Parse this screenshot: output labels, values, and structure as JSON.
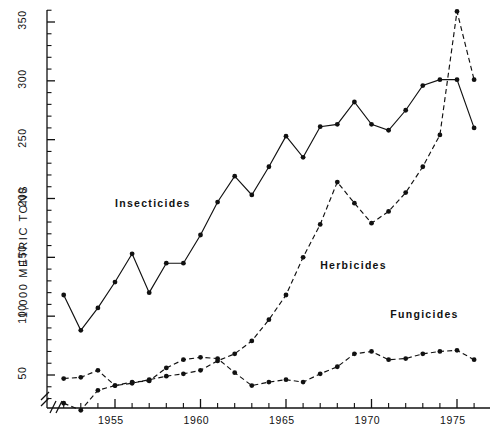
{
  "chart_data": {
    "type": "line",
    "title": "",
    "xlabel": "",
    "ylabel": "1,000 METRIC TONS",
    "xlim": [
      1951.2,
      1976.6
    ],
    "ylim": [
      14,
      372
    ],
    "grid": false,
    "legend": "inline-annotations",
    "axis_break": "//",
    "x_ticks_major": [
      "1955",
      "1960",
      "1965",
      "1970",
      "1975"
    ],
    "x_ticks_major_values": [
      1955,
      1960,
      1965,
      1970,
      1975
    ],
    "x_ticks_minor_values": [
      1952,
      1953,
      1954,
      1956,
      1957,
      1958,
      1959,
      1961,
      1962,
      1963,
      1964,
      1966,
      1967,
      1968,
      1969,
      1971,
      1972,
      1973,
      1974,
      1976
    ],
    "y_ticks_major": [
      "50",
      "100",
      "150",
      "200",
      "250",
      "300",
      "350"
    ],
    "y_ticks_major_values": [
      50,
      100,
      150,
      200,
      250,
      300,
      350
    ],
    "y_ticks_minor_values": [
      20,
      30,
      40,
      60,
      70,
      80,
      90,
      110,
      120,
      130,
      140,
      160,
      170,
      180,
      190,
      210,
      220,
      230,
      240,
      260,
      270,
      280,
      290,
      310,
      320,
      330,
      340,
      360,
      370
    ],
    "series": [
      {
        "name": "Insecticides",
        "style": "solid",
        "marker": "filled-circle",
        "label_x": 1955.0,
        "label_y": 195,
        "x": [
          1952,
          1953,
          1954,
          1955,
          1956,
          1957,
          1958,
          1959,
          1960,
          1961,
          1962,
          1963,
          1964,
          1965,
          1966,
          1967,
          1968,
          1969,
          1970,
          1971,
          1972,
          1973,
          1974,
          1975,
          1976
        ],
        "values": [
          118,
          88,
          107,
          129,
          153,
          120,
          145,
          145,
          169,
          197,
          219,
          203,
          227,
          253,
          235,
          261,
          263,
          282,
          263,
          258,
          275,
          296,
          301,
          301,
          260
        ]
      },
      {
        "name": "Herbicides",
        "style": "dashed",
        "marker": "filled-circle",
        "label_x": 1967.0,
        "label_y": 143,
        "x": [
          1952,
          1953,
          1954,
          1955,
          1956,
          1957,
          1958,
          1959,
          1960,
          1961,
          1962,
          1963,
          1964,
          1965,
          1966,
          1967,
          1968,
          1969,
          1970,
          1971,
          1972,
          1973,
          1974,
          1975,
          1976
        ],
        "values": [
          26,
          20,
          37,
          41,
          43,
          46,
          49,
          51,
          54,
          62,
          68,
          79,
          97,
          118,
          150,
          178,
          214,
          196,
          179,
          189,
          205,
          227,
          254,
          359,
          301
        ]
      },
      {
        "name": "Fungicides",
        "style": "dashed",
        "marker": "filled-circle",
        "label_x": 1971.1,
        "label_y": 101,
        "x": [
          1952,
          1953,
          1954,
          1955,
          1956,
          1957,
          1958,
          1959,
          1960,
          1961,
          1962,
          1963,
          1964,
          1965,
          1966,
          1967,
          1968,
          1969,
          1970,
          1971,
          1972,
          1973,
          1974,
          1975,
          1976
        ],
        "values": [
          47,
          48,
          54,
          41,
          44,
          45,
          56,
          63,
          65,
          64,
          52,
          41,
          44,
          46,
          44,
          51,
          57,
          68,
          70,
          63,
          64,
          68,
          70,
          71,
          63
        ]
      }
    ]
  }
}
